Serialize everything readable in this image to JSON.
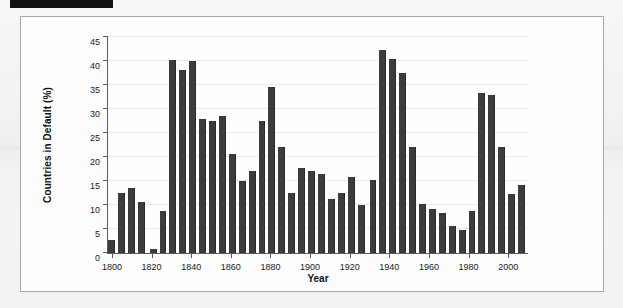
{
  "page": {
    "redaction_bar": true,
    "background_color": "#f2f2f2",
    "figure_border_color": "#a8a8a8"
  },
  "chart_data": {
    "type": "bar",
    "title": "",
    "xlabel": "Year",
    "ylabel": "Countries in Default (%)",
    "xlim": [
      1798,
      2010
    ],
    "ylim": [
      0,
      45
    ],
    "yticks": [
      0,
      5,
      10,
      15,
      20,
      25,
      30,
      35,
      40,
      45
    ],
    "xticks": [
      1800,
      1820,
      1840,
      1860,
      1880,
      1900,
      1920,
      1940,
      1960,
      1980,
      2000
    ],
    "grid": "horizontal",
    "legend": "none",
    "bar_color": "#3c3c3c",
    "bar_width_years": 4,
    "categories": [
      1800,
      1805,
      1810,
      1815,
      1821,
      1826,
      1831,
      1836,
      1841,
      1846,
      1851,
      1856,
      1861,
      1866,
      1871,
      1876,
      1881,
      1886,
      1891,
      1896,
      1901,
      1906,
      1911,
      1916,
      1921,
      1926,
      1932,
      1937,
      1942,
      1947,
      1952,
      1957,
      1962,
      1967,
      1972,
      1977,
      1982,
      1987,
      1992,
      1997,
      2002,
      2007
    ],
    "values": [
      2.7,
      12.5,
      13.6,
      10.7,
      0.9,
      8.8,
      40.2,
      38.1,
      39.9,
      27.9,
      27.4,
      28.5,
      20.7,
      14.9,
      17.1,
      27.4,
      34.6,
      22.0,
      12.5,
      17.7,
      17.1,
      16.5,
      11.2,
      12.5,
      15.9,
      10.0,
      15.3,
      42.3,
      40.4,
      37.6,
      22.1,
      10.3,
      9.2,
      8.3,
      5.6,
      4.7,
      8.7,
      33.3,
      32.9,
      22.0,
      12.3,
      14.1
    ]
  }
}
